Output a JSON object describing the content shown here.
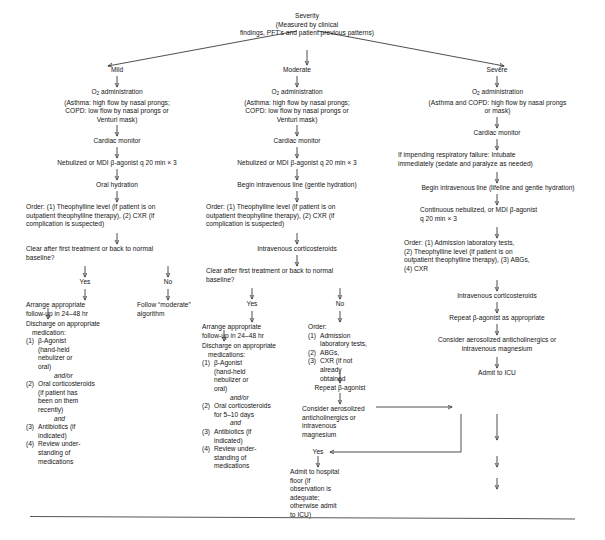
{
  "document": {
    "type": "clinical-algorithm-flowchart",
    "title_node": "Severity\n(Measured by clinical\nfindings, PFT's and patient previous patterns)",
    "has_bottom_rule": true
  },
  "branches": {
    "mild": {
      "label": "Mild",
      "steps": {
        "oxygen": "O2 administration\n(Asthma: high flow by nasal prongs;\nCOPD: low flow by nasal prongs or\nVenturi mask)",
        "cardiac": "Cardiac monitor",
        "bronchodilator": "Nebulized or MDI β-agonist q 20 min × 3",
        "hydration": "Oral hydration",
        "order": "Order: (1) Theophylline level (if patient is on\noutpatient theophylline therapy), (2) CXR (if\ncomplication is suspected)",
        "decision": "Clear after first treatment or back to normal\nbaseline?",
        "yes_label": "Yes",
        "no_label": "No",
        "yes_path": "Arrange appropriate\nfollow-up in 24–48 hr",
        "no_path": "Follow “moderate”\nalgorithm"
      },
      "discharge": {
        "heading": "Discharge on appropriate",
        "subheading": "medication:",
        "items": [
          {
            "num": "(1)",
            "text": "β-Agonist\n(hand-held\nnebulizer or\noral)"
          },
          {
            "num": "(2)",
            "text": "Oral corticosteroids\n(if patient has\nbeen on them\nrecently)"
          },
          {
            "num": "(3)",
            "text": "Antibiotics (if\nindicated)"
          },
          {
            "num": "(4)",
            "text": "Review under-\nstanding of\nmedications"
          }
        ],
        "conj1": "and/or",
        "conj2": "and"
      }
    },
    "moderate": {
      "label": "Moderate",
      "steps": {
        "oxygen": "O2 administration\n(Asthma: high flow by nasal prongs;\nCOPD: low flow by nasal prongs or\nVenturi mask)",
        "cardiac": "Cardiac monitor",
        "bronchodilator": "Nebulized or MDI β-agonist q 20 min × 3",
        "iv_line": "Begin intravenous line (gentle hydration)",
        "order": "Order: (1) Theophylline level (if patient is on\noutpatient theophylline therapy), (2) CXR (if\ncomplication is suspected)",
        "steroids": "Intravenous corticosteroids",
        "decision": "Clear after first treatment or back to normal\nbaseline?",
        "yes_label": "Yes",
        "no_label": "No",
        "yes_path": "Arrange appropriate\nfollow-up in 24–48 hr"
      },
      "discharge": {
        "heading": "Discharge on appropriate",
        "subheading": "medications:",
        "items": [
          {
            "num": "(1)",
            "text": "β-Agonist\n(hand-held\nnebulizer or\noral)"
          },
          {
            "num": "(2)",
            "text": "Oral corticosteroids\nfor 5–10 days"
          },
          {
            "num": "(3)",
            "text": "Antibiotics (if\nindicated)"
          },
          {
            "num": "(4)",
            "text": "Review under-\nstanding of\nmedications"
          }
        ],
        "conj1": "and/or",
        "conj2": "and"
      },
      "no_branch": {
        "order_heading": "Order:",
        "items": [
          {
            "num": "(1)",
            "text": "Admission\nlaboratory tests,"
          },
          {
            "num": "(2)",
            "text": "ABGs,"
          },
          {
            "num": "(3)",
            "text": "CXR (if not\nalready\nobtained"
          }
        ],
        "repeat": "Repeat β-agonist",
        "consider": "Consider aerosolized\nanticholinergics or\nintravenous\nmagnesium",
        "yes_label": "Yes",
        "admit": "Admit to hospital\nfloor (if\nobservation is\nadequate;\notherwise admit\nto ICU)"
      }
    },
    "severe": {
      "label": "Severe",
      "steps": {
        "oxygen": "O2 administration\n(Asthma and COPD: high flow by nasal prongs\nor mask)",
        "cardiac": "Cardiac monitor",
        "intubate": "If impending respiratory failure: Intubate\nimmediately (sedate and paralyze as needed)",
        "iv_line": "Begin intravenous line (lifeline and gentle hydration)",
        "continuous": "Continuous nebulized, or MDI β-agonist\nq 20 min × 3",
        "order": "Order: (1) Admission laboratory tests,\n(2) Theophylline level (if patient is on\noutpatient theophylline therapy), (3) ABGs,\n(4) CXR",
        "steroids": "Intravenous corticosteroids",
        "repeat": "Repeat β-agonist as appropriate",
        "consider": "Consider aerosolized anticholinergics or\nintravenous magnesium",
        "admit_icu": "Admit to ICU"
      }
    },
    "outcome": {
      "decision": "Significantly improved?",
      "no_label": "No",
      "continue": "Continue β-agonist aerosols",
      "admit_icu": "Admit to ICU"
    }
  }
}
